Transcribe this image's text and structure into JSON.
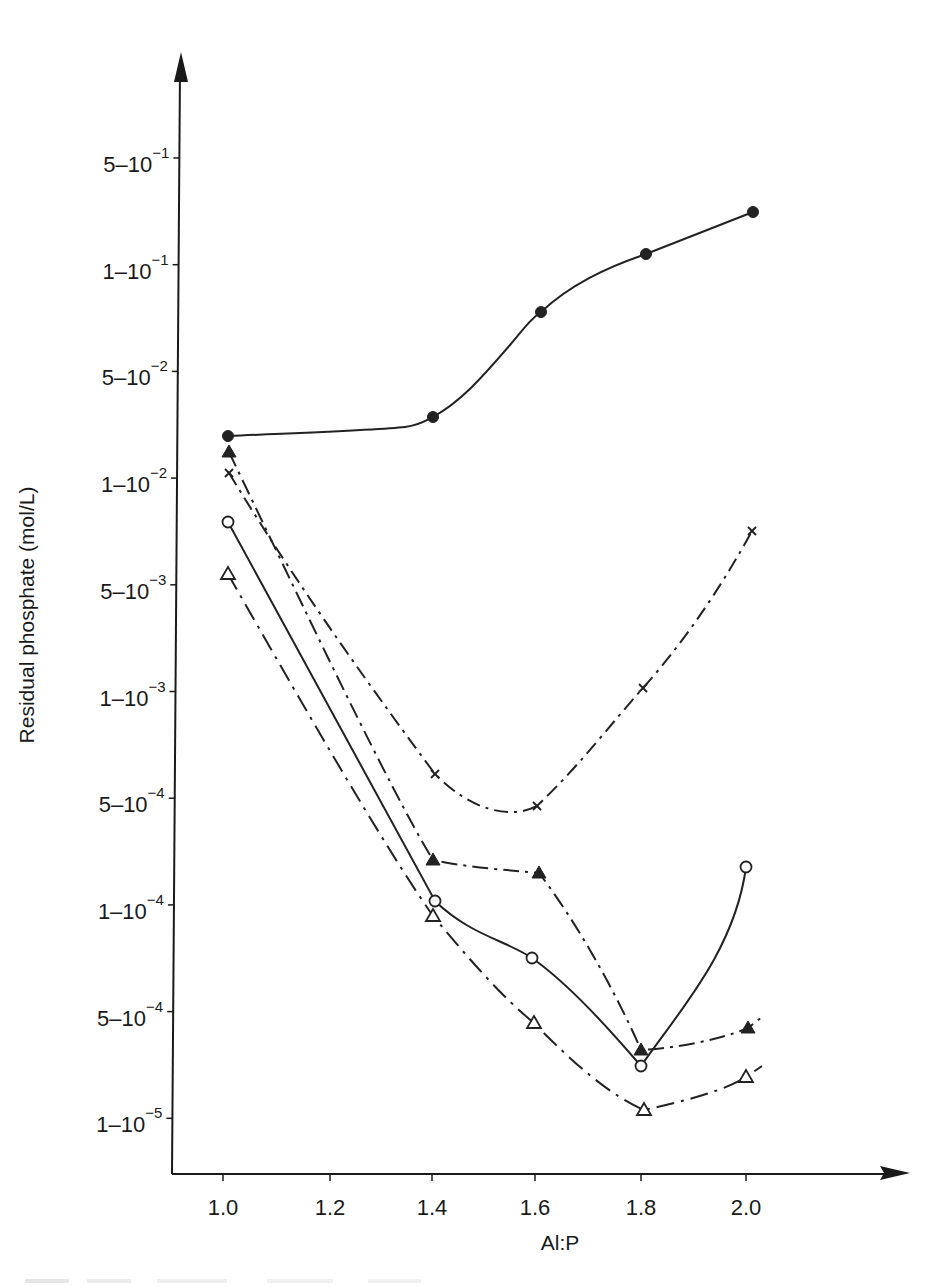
{
  "chart_data": {
    "type": "line",
    "title": "",
    "xlabel": "Al:P",
    "ylabel": "Residual phosphate (mol/L)",
    "x_ticks": [
      "1.0",
      "1.2",
      "1.4",
      "1.6",
      "1.8",
      "2.0"
    ],
    "x_tick_values": [
      1.0,
      1.2,
      1.4,
      1.6,
      1.8,
      2.0
    ],
    "y_scale": "log (labels evenly spaced, alternating 5 and 1 per decade)",
    "y_ticks": [
      {
        "mant": "5",
        "exp": "−1",
        "value": 0.5
      },
      {
        "mant": "1",
        "exp": "−1",
        "value": 0.1
      },
      {
        "mant": "5",
        "exp": "−2",
        "value": 0.05
      },
      {
        "mant": "1",
        "exp": "−2",
        "value": 0.01
      },
      {
        "mant": "5",
        "exp": "−3",
        "value": 0.005
      },
      {
        "mant": "1",
        "exp": "−3",
        "value": 0.001
      },
      {
        "mant": "5",
        "exp": "−4",
        "value": 0.0005
      },
      {
        "mant": "1",
        "exp": "−4",
        "value": 0.0001
      },
      {
        "mant": "5",
        "exp": "−4",
        "value": 5e-05,
        "note": "printed as 5-10^-4 (likely typo for 5-10^-5)"
      },
      {
        "mant": "1",
        "exp": "−5",
        "value": 1e-05
      }
    ],
    "grid": false,
    "legend": "none",
    "x": [
      1.0,
      1.4,
      1.6,
      1.8,
      2.0
    ],
    "series": [
      {
        "name": "filled circles",
        "marker": "filled-circle",
        "line": "solid",
        "values": [
          0.02,
          0.025,
          0.075,
          0.12,
          0.2
        ]
      },
      {
        "name": "crosses",
        "marker": "cross",
        "line": "dash-dot",
        "values": [
          0.011,
          0.0006,
          0.00045,
          0.001,
          0.0075
        ]
      },
      {
        "name": "filled triangles",
        "marker": "filled-triangle",
        "line": "dash-dot",
        "values": [
          0.014,
          0.00025,
          0.00022,
          3e-05,
          4e-05
        ]
      },
      {
        "name": "open circles",
        "marker": "open-circle",
        "line": "solid",
        "values": [
          0.0075,
          0.00011,
          7e-05,
          2.5e-05,
          0.00022
        ]
      },
      {
        "name": "open triangles",
        "marker": "open-triangle",
        "line": "dash-dot",
        "values": [
          0.0055,
          9e-05,
          4e-05,
          1.1e-05,
          1.7e-05
        ]
      }
    ]
  },
  "render": {
    "series_px": [
      {
        "marker": "filled-circle",
        "dash": "",
        "pts": [
          [
            228,
            436
          ],
          [
            433,
            417
          ],
          [
            541,
            312
          ],
          [
            646,
            254
          ],
          [
            753,
            212
          ]
        ],
        "path": "M228,436 C320,432 380,430 405,427 C420,425 425,421 433,417 C460,402 480,380 510,345 C525,327 532,318 541,312 C570,285 605,268 646,254 L753,212"
      },
      {
        "marker": "cross",
        "dash": "14,6,3,6",
        "pts": [
          [
            229,
            473
          ],
          [
            435,
            774
          ],
          [
            537,
            806
          ],
          [
            643,
            688
          ],
          [
            752,
            531
          ]
        ],
        "path": "M229,473 C300,590 380,700 435,774 C470,810 510,820 537,806 C580,765 610,725 643,688 C690,635 725,580 752,531"
      },
      {
        "marker": "filled-triangle",
        "dash": "16,6,3,6",
        "pts": [
          [
            229,
            452
          ],
          [
            433,
            860
          ],
          [
            539,
            873
          ],
          [
            641,
            1050
          ],
          [
            748,
            1028
          ]
        ],
        "path": "M229,452 C300,600 390,790 433,860 C470,868 510,870 539,873 C575,920 615,990 641,1050 C675,1048 720,1040 748,1028 L762,1017"
      },
      {
        "marker": "open-circle",
        "dash": "",
        "pts": [
          [
            228,
            522
          ],
          [
            435,
            901
          ],
          [
            532,
            958
          ],
          [
            641,
            1066
          ],
          [
            746,
            867
          ]
        ],
        "path": "M228,522 L435,901 C470,935 505,940 532,958 C570,985 610,1030 641,1066 C680,1010 735,950 746,867"
      },
      {
        "marker": "open-triangle",
        "dash": "18,7,3,7",
        "pts": [
          [
            228,
            574
          ],
          [
            433,
            916
          ],
          [
            534,
            1023
          ],
          [
            644,
            1110
          ],
          [
            746,
            1077
          ]
        ],
        "path": "M228,574 C300,700 380,840 433,916 C470,960 500,995 534,1023 C575,1065 610,1095 644,1110 C690,1100 725,1090 746,1077 L762,1066"
      }
    ]
  }
}
